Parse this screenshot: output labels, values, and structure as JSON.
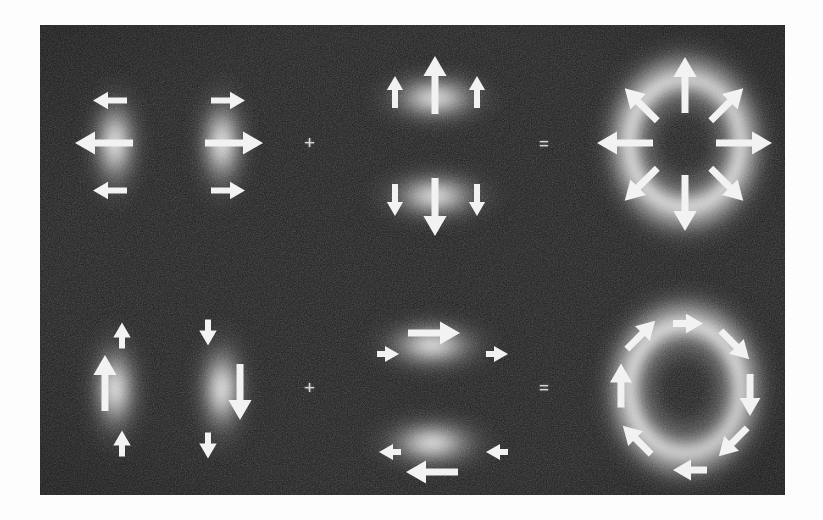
{
  "figure": {
    "plate": {
      "x": 40,
      "y": 25,
      "width": 745,
      "height": 470,
      "background_color": "#1d1d1d",
      "border_color": "#fdfdfd",
      "grain": true
    },
    "operators": [
      {
        "name": "plus-top",
        "symbol": "+",
        "x": 310,
        "y": 143
      },
      {
        "name": "equals-top",
        "symbol": "=",
        "x": 545,
        "y": 145
      },
      {
        "name": "plus-bottom",
        "symbol": "+",
        "x": 310,
        "y": 388
      },
      {
        "name": "equals-bottom",
        "symbol": "=",
        "x": 545,
        "y": 389
      }
    ],
    "rows": [
      {
        "id": "row-radial",
        "label": "radial polarization synthesis",
        "terms": [
          {
            "id": "term-1-hg01-x",
            "label": "HG01 horizontally polarized vertical lobe pair",
            "polarization": "horizontal",
            "blobs": [
              {
                "name": "lobe-left",
                "shape": "lobe-v",
                "cx": 115,
                "cy": 143,
                "rx": 36,
                "ry": 72
              },
              {
                "name": "lobe-right",
                "shape": "lobe-v",
                "cx": 222,
                "cy": 143,
                "rx": 36,
                "ry": 72
              }
            ],
            "arrows": [
              {
                "name": "arrow-left-top",
                "cx": 110,
                "cy": 100,
                "angle": 180,
                "length": 34,
                "head": 15,
                "shaft": 6
              },
              {
                "name": "arrow-left-middle",
                "cx": 104,
                "cy": 143,
                "angle": 180,
                "length": 58,
                "head": 20,
                "shaft": 7
              },
              {
                "name": "arrow-left-bottom",
                "cx": 110,
                "cy": 190,
                "angle": 180,
                "length": 34,
                "head": 15,
                "shaft": 6
              },
              {
                "name": "arrow-right-top",
                "cx": 228,
                "cy": 100,
                "angle": 0,
                "length": 34,
                "head": 15,
                "shaft": 6
              },
              {
                "name": "arrow-right-middle",
                "cx": 234,
                "cy": 143,
                "angle": 0,
                "length": 58,
                "head": 20,
                "shaft": 7
              },
              {
                "name": "arrow-right-bottom",
                "cx": 228,
                "cy": 190,
                "angle": 0,
                "length": 34,
                "head": 15,
                "shaft": 6
              }
            ]
          },
          {
            "id": "term-2-hg10-y",
            "label": "HG10 vertically polarized horizontal lobe pair",
            "polarization": "vertical",
            "blobs": [
              {
                "name": "lobe-top",
                "shape": "lobe-h",
                "cx": 435,
                "cy": 98,
                "rx": 72,
                "ry": 36
              },
              {
                "name": "lobe-bottom",
                "shape": "lobe-h",
                "cx": 435,
                "cy": 196,
                "rx": 72,
                "ry": 36
              }
            ],
            "arrows": [
              {
                "name": "arrow-top-left",
                "cx": 395,
                "cy": 92,
                "angle": 270,
                "length": 32,
                "head": 14,
                "shaft": 6
              },
              {
                "name": "arrow-top-center",
                "cx": 435,
                "cy": 85,
                "angle": 270,
                "length": 58,
                "head": 20,
                "shaft": 7
              },
              {
                "name": "arrow-top-right",
                "cx": 477,
                "cy": 92,
                "angle": 270,
                "length": 32,
                "head": 14,
                "shaft": 6
              },
              {
                "name": "arrow-bottom-left",
                "cx": 395,
                "cy": 200,
                "angle": 90,
                "length": 32,
                "head": 14,
                "shaft": 6
              },
              {
                "name": "arrow-bottom-center",
                "cx": 435,
                "cy": 207,
                "angle": 90,
                "length": 58,
                "head": 20,
                "shaft": 7
              },
              {
                "name": "arrow-bottom-right",
                "cx": 477,
                "cy": 200,
                "angle": 90,
                "length": 32,
                "head": 14,
                "shaft": 6
              }
            ]
          },
          {
            "id": "term-3-radial-donut",
            "label": "radially polarized donut mode",
            "polarization": "radial",
            "blobs": [
              {
                "name": "donut",
                "shape": "donut",
                "cx": 685,
                "cy": 143,
                "rx": 95,
                "ry": 110
              }
            ],
            "arrows": [
              {
                "name": "arrow-n",
                "cx": 685,
                "cy": 85,
                "angle": 270,
                "length": 56,
                "head": 20,
                "shaft": 7
              },
              {
                "name": "arrow-ne",
                "cx": 727,
                "cy": 104,
                "angle": 315,
                "length": 46,
                "head": 19,
                "shaft": 7
              },
              {
                "name": "arrow-e",
                "cx": 744,
                "cy": 143,
                "angle": 0,
                "length": 56,
                "head": 20,
                "shaft": 7
              },
              {
                "name": "arrow-se",
                "cx": 727,
                "cy": 184,
                "angle": 45,
                "length": 46,
                "head": 19,
                "shaft": 7
              },
              {
                "name": "arrow-s",
                "cx": 685,
                "cy": 203,
                "angle": 90,
                "length": 56,
                "head": 20,
                "shaft": 7
              },
              {
                "name": "arrow-sw",
                "cx": 641,
                "cy": 184,
                "angle": 135,
                "length": 46,
                "head": 19,
                "shaft": 7
              },
              {
                "name": "arrow-w",
                "cx": 625,
                "cy": 143,
                "angle": 180,
                "length": 56,
                "head": 20,
                "shaft": 7
              },
              {
                "name": "arrow-nw",
                "cx": 641,
                "cy": 104,
                "angle": 225,
                "length": 46,
                "head": 19,
                "shaft": 7
              }
            ]
          }
        ]
      },
      {
        "id": "row-azimuthal",
        "label": "azimuthal polarization synthesis",
        "terms": [
          {
            "id": "term-4-hg01-y",
            "label": "HG01 vertically polarized vertical lobe pair",
            "polarization": "vertical",
            "blobs": [
              {
                "name": "lobe-left",
                "shape": "lobe-v",
                "cx": 115,
                "cy": 389,
                "rx": 36,
                "ry": 72
              },
              {
                "name": "lobe-right",
                "shape": "lobe-v",
                "cx": 222,
                "cy": 389,
                "rx": 36,
                "ry": 72
              }
            ],
            "arrows": [
              {
                "name": "arrow-left-top",
                "cx": 122,
                "cy": 335,
                "angle": 270,
                "length": 26,
                "head": 15,
                "shaft": 6
              },
              {
                "name": "arrow-left-middle",
                "cx": 105,
                "cy": 383,
                "angle": 270,
                "length": 56,
                "head": 20,
                "shaft": 7
              },
              {
                "name": "arrow-left-bottom",
                "cx": 122,
                "cy": 443,
                "angle": 270,
                "length": 26,
                "head": 15,
                "shaft": 6
              },
              {
                "name": "arrow-right-top",
                "cx": 208,
                "cy": 332,
                "angle": 90,
                "length": 26,
                "head": 15,
                "shaft": 6
              },
              {
                "name": "arrow-right-middle",
                "cx": 240,
                "cy": 392,
                "angle": 90,
                "length": 56,
                "head": 20,
                "shaft": 7
              },
              {
                "name": "arrow-right-bottom",
                "cx": 208,
                "cy": 445,
                "angle": 90,
                "length": 26,
                "head": 15,
                "shaft": 6
              }
            ]
          },
          {
            "id": "term-5-hg10-x",
            "label": "HG10 horizontally polarized horizontal lobe pair",
            "polarization": "horizontal",
            "blobs": [
              {
                "name": "lobe-top",
                "shape": "lobe-h",
                "cx": 432,
                "cy": 345,
                "rx": 72,
                "ry": 36
              },
              {
                "name": "lobe-bottom",
                "shape": "lobe-h",
                "cx": 432,
                "cy": 443,
                "rx": 72,
                "ry": 36
              }
            ],
            "arrows": [
              {
                "name": "arrow-top-left",
                "cx": 388,
                "cy": 354,
                "angle": 0,
                "length": 22,
                "head": 14,
                "shaft": 6
              },
              {
                "name": "arrow-top-center",
                "cx": 434,
                "cy": 333,
                "angle": 0,
                "length": 52,
                "head": 20,
                "shaft": 7
              },
              {
                "name": "arrow-top-right",
                "cx": 497,
                "cy": 354,
                "angle": 0,
                "length": 22,
                "head": 14,
                "shaft": 6
              },
              {
                "name": "arrow-bottom-left",
                "cx": 390,
                "cy": 452,
                "angle": 180,
                "length": 22,
                "head": 14,
                "shaft": 6
              },
              {
                "name": "arrow-bottom-center",
                "cx": 432,
                "cy": 472,
                "angle": 180,
                "length": 52,
                "head": 20,
                "shaft": 7
              },
              {
                "name": "arrow-bottom-right",
                "cx": 497,
                "cy": 452,
                "angle": 180,
                "length": 22,
                "head": 14,
                "shaft": 6
              }
            ]
          },
          {
            "id": "term-6-azimuthal-donut",
            "label": "azimuthally polarized donut mode",
            "polarization": "azimuthal",
            "blobs": [
              {
                "name": "donut",
                "shape": "donut",
                "cx": 685,
                "cy": 389,
                "rx": 95,
                "ry": 110
              }
            ],
            "arrows": [
              {
                "name": "arrow-n",
                "cx": 688,
                "cy": 323,
                "angle": 0,
                "length": 30,
                "head": 17,
                "shaft": 7
              },
              {
                "name": "arrow-ne",
                "cx": 735,
                "cy": 345,
                "angle": 45,
                "length": 40,
                "head": 18,
                "shaft": 7
              },
              {
                "name": "arrow-e",
                "cx": 750,
                "cy": 395,
                "angle": 90,
                "length": 42,
                "head": 18,
                "shaft": 7
              },
              {
                "name": "arrow-se",
                "cx": 733,
                "cy": 442,
                "angle": 135,
                "length": 40,
                "head": 18,
                "shaft": 7
              },
              {
                "name": "arrow-s",
                "cx": 690,
                "cy": 470,
                "angle": 180,
                "length": 34,
                "head": 18,
                "shaft": 7
              },
              {
                "name": "arrow-sw",
                "cx": 637,
                "cy": 440,
                "angle": 225,
                "length": 40,
                "head": 18,
                "shaft": 7
              },
              {
                "name": "arrow-w",
                "cx": 621,
                "cy": 385,
                "angle": 270,
                "length": 44,
                "head": 19,
                "shaft": 7
              },
              {
                "name": "arrow-nw",
                "cx": 641,
                "cy": 335,
                "angle": 315,
                "length": 40,
                "head": 18,
                "shaft": 7
              }
            ]
          }
        ]
      }
    ],
    "colors": {
      "plate_background": "#1d1d1d",
      "page_background": "#fdfdfd",
      "arrow_fill": "#f2f2f2",
      "beam_peak": "#ffffff",
      "operator": "#d8d8d8"
    }
  }
}
